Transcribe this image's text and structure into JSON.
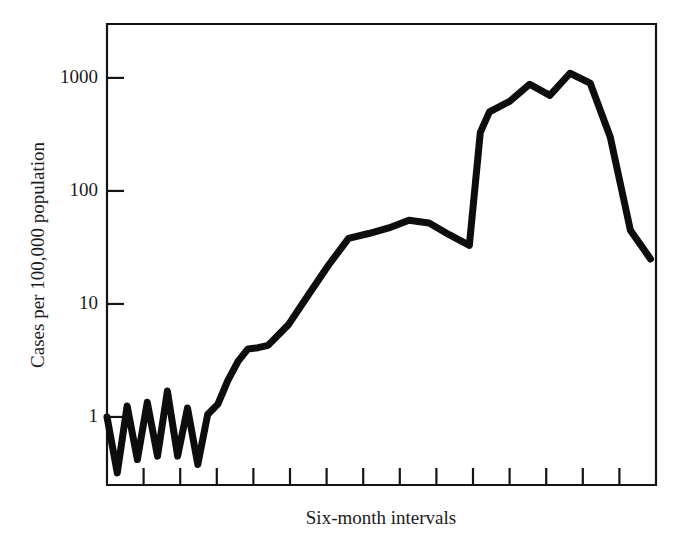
{
  "chart_data": {
    "type": "line",
    "title": "",
    "subtitle": "",
    "xlabel": "Six-month intervals",
    "ylabel": "Cases per 100,000 population",
    "yscale": "log",
    "ylim": [
      0.25,
      3000
    ],
    "ytick_values": [
      1,
      10,
      100,
      1000
    ],
    "ytick_labels": [
      "1",
      "10",
      "100",
      "1000"
    ],
    "xlim": [
      0,
      15
    ],
    "xtick_values": [
      1,
      2,
      3,
      4,
      5,
      6,
      7,
      8,
      9,
      10,
      11,
      12,
      13,
      14
    ],
    "xtick_labels": [
      "",
      "",
      "",
      "",
      "",
      "",
      "",
      "",
      "",
      "",
      "",
      "",
      "",
      ""
    ],
    "grid": false,
    "legend": null,
    "annotations": [],
    "series": [
      {
        "name": "Cases per 100,000 population",
        "color": "#0d0d0d",
        "x": [
          0.0,
          0.28,
          0.55,
          0.83,
          1.1,
          1.38,
          1.65,
          1.93,
          2.2,
          2.48,
          2.75,
          3.03,
          3.3,
          3.58,
          3.85,
          4.13,
          4.4,
          4.95,
          5.5,
          6.05,
          6.6,
          7.15,
          7.7,
          8.25,
          8.8,
          9.35,
          9.9,
          10.2,
          10.45,
          11.0,
          11.55,
          12.1,
          12.65,
          13.2,
          13.75,
          14.3,
          14.85
        ],
        "y": [
          1.0,
          0.32,
          1.25,
          0.42,
          1.35,
          0.45,
          1.7,
          0.45,
          1.2,
          0.38,
          1.05,
          1.3,
          2.1,
          3.1,
          4.0,
          4.1,
          4.3,
          6.5,
          12.0,
          22.0,
          38.0,
          42.0,
          47.0,
          55.0,
          52.0,
          41.0,
          33.0,
          330.0,
          500.0,
          620.0,
          880.0,
          700.0,
          1100.0,
          900.0,
          300.0,
          45.0,
          25.0
        ]
      }
    ]
  },
  "axes": {
    "y_axis_name": "y-axis-log-scale",
    "x_axis_name": "x-axis-intervals"
  }
}
